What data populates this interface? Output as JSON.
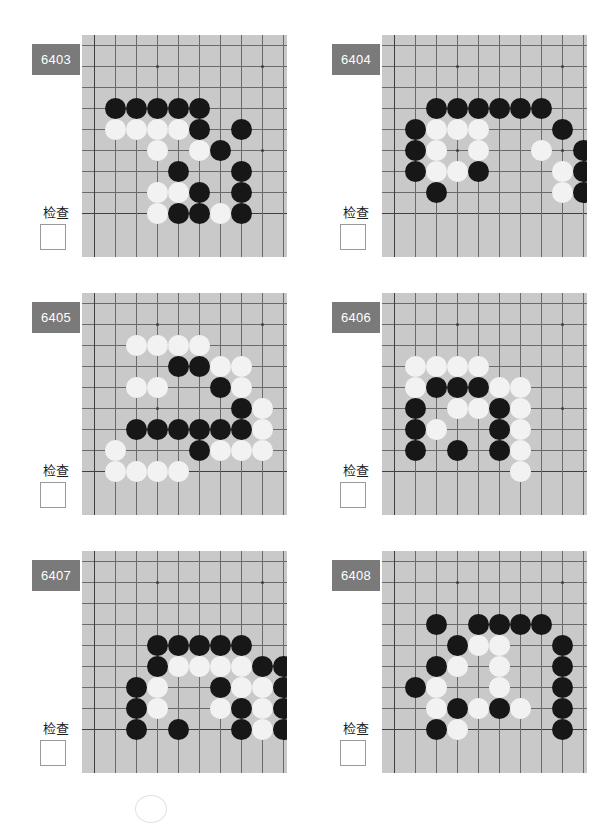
{
  "page": {
    "width": 599,
    "height": 813,
    "background": "#ffffff"
  },
  "theme": {
    "badge_bg": "#7a7a7a",
    "badge_text": "#ffffff",
    "board_bg": "#c9c9c9",
    "grid_line": "#6a6a6a",
    "edge_line": "#3f3f3f",
    "black_stone": "#171717",
    "white_stone": "#f2f2f2",
    "checkbox_border": "#9a9a9a"
  },
  "common": {
    "check_label": "检查",
    "checkbox_checked": false
  },
  "board_geometry": {
    "cols": 9,
    "rows": 9,
    "cell": 21,
    "origin_x": 12,
    "origin_y": 10,
    "left_edge_col": 0,
    "bottom_edge_row": 8,
    "star_points": [
      [
        3,
        1
      ],
      [
        8,
        1
      ],
      [
        3,
        5
      ],
      [
        8,
        5
      ]
    ]
  },
  "puzzles": [
    {
      "id": "6403",
      "position": {
        "left": 10,
        "top": 30
      },
      "check_label": "检查",
      "stones": [
        {
          "c": 1,
          "r": 3,
          "color": "b"
        },
        {
          "c": 2,
          "r": 3,
          "color": "b"
        },
        {
          "c": 3,
          "r": 3,
          "color": "b"
        },
        {
          "c": 4,
          "r": 3,
          "color": "b"
        },
        {
          "c": 5,
          "r": 3,
          "color": "b"
        },
        {
          "c": 1,
          "r": 4,
          "color": "w"
        },
        {
          "c": 2,
          "r": 4,
          "color": "w"
        },
        {
          "c": 3,
          "r": 4,
          "color": "w"
        },
        {
          "c": 4,
          "r": 4,
          "color": "w"
        },
        {
          "c": 5,
          "r": 4,
          "color": "b"
        },
        {
          "c": 7,
          "r": 4,
          "color": "b"
        },
        {
          "c": 3,
          "r": 5,
          "color": "w"
        },
        {
          "c": 5,
          "r": 5,
          "color": "w"
        },
        {
          "c": 6,
          "r": 5,
          "color": "b"
        },
        {
          "c": 4,
          "r": 6,
          "color": "b"
        },
        {
          "c": 7,
          "r": 6,
          "color": "b"
        },
        {
          "c": 3,
          "r": 7,
          "color": "w"
        },
        {
          "c": 4,
          "r": 7,
          "color": "w"
        },
        {
          "c": 5,
          "r": 7,
          "color": "b"
        },
        {
          "c": 7,
          "r": 7,
          "color": "b"
        },
        {
          "c": 3,
          "r": 8,
          "color": "w"
        },
        {
          "c": 4,
          "r": 8,
          "color": "b"
        },
        {
          "c": 5,
          "r": 8,
          "color": "b"
        },
        {
          "c": 6,
          "r": 8,
          "color": "w"
        },
        {
          "c": 7,
          "r": 8,
          "color": "b"
        }
      ]
    },
    {
      "id": "6404",
      "position": {
        "left": 310,
        "top": 30
      },
      "check_label": "检查",
      "stones": [
        {
          "c": 2,
          "r": 3,
          "color": "b"
        },
        {
          "c": 3,
          "r": 3,
          "color": "b"
        },
        {
          "c": 4,
          "r": 3,
          "color": "b"
        },
        {
          "c": 5,
          "r": 3,
          "color": "b"
        },
        {
          "c": 6,
          "r": 3,
          "color": "b"
        },
        {
          "c": 7,
          "r": 3,
          "color": "b"
        },
        {
          "c": 1,
          "r": 4,
          "color": "b"
        },
        {
          "c": 2,
          "r": 4,
          "color": "w"
        },
        {
          "c": 3,
          "r": 4,
          "color": "w"
        },
        {
          "c": 4,
          "r": 4,
          "color": "w"
        },
        {
          "c": 8,
          "r": 4,
          "color": "b"
        },
        {
          "c": 1,
          "r": 5,
          "color": "b"
        },
        {
          "c": 2,
          "r": 5,
          "color": "w"
        },
        {
          "c": 4,
          "r": 5,
          "color": "w"
        },
        {
          "c": 7,
          "r": 5,
          "color": "w"
        },
        {
          "c": 9,
          "r": 5,
          "color": "b"
        },
        {
          "c": 1,
          "r": 6,
          "color": "b"
        },
        {
          "c": 2,
          "r": 6,
          "color": "w"
        },
        {
          "c": 3,
          "r": 6,
          "color": "w"
        },
        {
          "c": 4,
          "r": 6,
          "color": "b"
        },
        {
          "c": 8,
          "r": 6,
          "color": "w"
        },
        {
          "c": 9,
          "r": 6,
          "color": "b"
        },
        {
          "c": 2,
          "r": 7,
          "color": "b"
        },
        {
          "c": 8,
          "r": 7,
          "color": "w"
        },
        {
          "c": 9,
          "r": 7,
          "color": "b"
        }
      ]
    },
    {
      "id": "6405",
      "position": {
        "left": 10,
        "top": 288
      },
      "check_label": "检查",
      "stones": [
        {
          "c": 2,
          "r": 2,
          "color": "w"
        },
        {
          "c": 3,
          "r": 2,
          "color": "w"
        },
        {
          "c": 4,
          "r": 2,
          "color": "w"
        },
        {
          "c": 5,
          "r": 2,
          "color": "w"
        },
        {
          "c": 4,
          "r": 3,
          "color": "b"
        },
        {
          "c": 5,
          "r": 3,
          "color": "b"
        },
        {
          "c": 6,
          "r": 3,
          "color": "w"
        },
        {
          "c": 7,
          "r": 3,
          "color": "w"
        },
        {
          "c": 2,
          "r": 4,
          "color": "w"
        },
        {
          "c": 3,
          "r": 4,
          "color": "w"
        },
        {
          "c": 6,
          "r": 4,
          "color": "b"
        },
        {
          "c": 7,
          "r": 4,
          "color": "w"
        },
        {
          "c": 7,
          "r": 5,
          "color": "b"
        },
        {
          "c": 8,
          "r": 5,
          "color": "w"
        },
        {
          "c": 2,
          "r": 6,
          "color": "b"
        },
        {
          "c": 3,
          "r": 6,
          "color": "b"
        },
        {
          "c": 4,
          "r": 6,
          "color": "b"
        },
        {
          "c": 5,
          "r": 6,
          "color": "b"
        },
        {
          "c": 6,
          "r": 6,
          "color": "b"
        },
        {
          "c": 7,
          "r": 6,
          "color": "b"
        },
        {
          "c": 8,
          "r": 6,
          "color": "w"
        },
        {
          "c": 1,
          "r": 7,
          "color": "w"
        },
        {
          "c": 5,
          "r": 7,
          "color": "b"
        },
        {
          "c": 6,
          "r": 7,
          "color": "w"
        },
        {
          "c": 7,
          "r": 7,
          "color": "w"
        },
        {
          "c": 8,
          "r": 7,
          "color": "w"
        },
        {
          "c": 1,
          "r": 8,
          "color": "w"
        },
        {
          "c": 2,
          "r": 8,
          "color": "w"
        },
        {
          "c": 3,
          "r": 8,
          "color": "w"
        },
        {
          "c": 4,
          "r": 8,
          "color": "w"
        }
      ]
    },
    {
      "id": "6406",
      "position": {
        "left": 310,
        "top": 288
      },
      "check_label": "检查",
      "stones": [
        {
          "c": 1,
          "r": 3,
          "color": "w"
        },
        {
          "c": 2,
          "r": 3,
          "color": "w"
        },
        {
          "c": 3,
          "r": 3,
          "color": "w"
        },
        {
          "c": 4,
          "r": 3,
          "color": "w"
        },
        {
          "c": 1,
          "r": 4,
          "color": "w"
        },
        {
          "c": 2,
          "r": 4,
          "color": "b"
        },
        {
          "c": 3,
          "r": 4,
          "color": "b"
        },
        {
          "c": 4,
          "r": 4,
          "color": "b"
        },
        {
          "c": 5,
          "r": 4,
          "color": "w"
        },
        {
          "c": 6,
          "r": 4,
          "color": "w"
        },
        {
          "c": 1,
          "r": 5,
          "color": "b"
        },
        {
          "c": 3,
          "r": 5,
          "color": "w"
        },
        {
          "c": 4,
          "r": 5,
          "color": "w"
        },
        {
          "c": 5,
          "r": 5,
          "color": "b"
        },
        {
          "c": 6,
          "r": 5,
          "color": "w"
        },
        {
          "c": 1,
          "r": 6,
          "color": "b"
        },
        {
          "c": 2,
          "r": 6,
          "color": "w"
        },
        {
          "c": 5,
          "r": 6,
          "color": "b"
        },
        {
          "c": 6,
          "r": 6,
          "color": "w"
        },
        {
          "c": 1,
          "r": 7,
          "color": "b"
        },
        {
          "c": 3,
          "r": 7,
          "color": "b"
        },
        {
          "c": 5,
          "r": 7,
          "color": "b"
        },
        {
          "c": 6,
          "r": 7,
          "color": "w"
        },
        {
          "c": 6,
          "r": 8,
          "color": "w"
        }
      ]
    },
    {
      "id": "6407",
      "position": {
        "left": 10,
        "top": 546
      },
      "check_label": "检查",
      "stones": [
        {
          "c": 3,
          "r": 4,
          "color": "b"
        },
        {
          "c": 4,
          "r": 4,
          "color": "b"
        },
        {
          "c": 5,
          "r": 4,
          "color": "b"
        },
        {
          "c": 6,
          "r": 4,
          "color": "b"
        },
        {
          "c": 7,
          "r": 4,
          "color": "b"
        },
        {
          "c": 3,
          "r": 5,
          "color": "b"
        },
        {
          "c": 4,
          "r": 5,
          "color": "w"
        },
        {
          "c": 5,
          "r": 5,
          "color": "w"
        },
        {
          "c": 6,
          "r": 5,
          "color": "w"
        },
        {
          "c": 7,
          "r": 5,
          "color": "w"
        },
        {
          "c": 8,
          "r": 5,
          "color": "b"
        },
        {
          "c": 9,
          "r": 5,
          "color": "b"
        },
        {
          "c": 2,
          "r": 6,
          "color": "b"
        },
        {
          "c": 3,
          "r": 6,
          "color": "w"
        },
        {
          "c": 6,
          "r": 6,
          "color": "b"
        },
        {
          "c": 7,
          "r": 6,
          "color": "w"
        },
        {
          "c": 8,
          "r": 6,
          "color": "w"
        },
        {
          "c": 9,
          "r": 6,
          "color": "b"
        },
        {
          "c": 2,
          "r": 7,
          "color": "b"
        },
        {
          "c": 3,
          "r": 7,
          "color": "w"
        },
        {
          "c": 6,
          "r": 7,
          "color": "w"
        },
        {
          "c": 7,
          "r": 7,
          "color": "b"
        },
        {
          "c": 8,
          "r": 7,
          "color": "w"
        },
        {
          "c": 9,
          "r": 7,
          "color": "b"
        },
        {
          "c": 2,
          "r": 8,
          "color": "b"
        },
        {
          "c": 4,
          "r": 8,
          "color": "b"
        },
        {
          "c": 7,
          "r": 8,
          "color": "b"
        },
        {
          "c": 8,
          "r": 8,
          "color": "w"
        },
        {
          "c": 9,
          "r": 8,
          "color": "b"
        }
      ]
    },
    {
      "id": "6408",
      "position": {
        "left": 310,
        "top": 546
      },
      "check_label": "检查",
      "stones": [
        {
          "c": 2,
          "r": 3,
          "color": "b"
        },
        {
          "c": 4,
          "r": 3,
          "color": "b"
        },
        {
          "c": 5,
          "r": 3,
          "color": "b"
        },
        {
          "c": 6,
          "r": 3,
          "color": "b"
        },
        {
          "c": 7,
          "r": 3,
          "color": "b"
        },
        {
          "c": 3,
          "r": 4,
          "color": "b"
        },
        {
          "c": 4,
          "r": 4,
          "color": "w"
        },
        {
          "c": 5,
          "r": 4,
          "color": "w"
        },
        {
          "c": 8,
          "r": 4,
          "color": "b"
        },
        {
          "c": 2,
          "r": 5,
          "color": "b"
        },
        {
          "c": 3,
          "r": 5,
          "color": "w"
        },
        {
          "c": 5,
          "r": 5,
          "color": "w"
        },
        {
          "c": 8,
          "r": 5,
          "color": "b"
        },
        {
          "c": 1,
          "r": 6,
          "color": "b"
        },
        {
          "c": 2,
          "r": 6,
          "color": "w"
        },
        {
          "c": 5,
          "r": 6,
          "color": "w"
        },
        {
          "c": 8,
          "r": 6,
          "color": "b"
        },
        {
          "c": 2,
          "r": 7,
          "color": "w"
        },
        {
          "c": 3,
          "r": 7,
          "color": "b"
        },
        {
          "c": 4,
          "r": 7,
          "color": "w"
        },
        {
          "c": 5,
          "r": 7,
          "color": "b"
        },
        {
          "c": 6,
          "r": 7,
          "color": "w"
        },
        {
          "c": 8,
          "r": 7,
          "color": "b"
        },
        {
          "c": 2,
          "r": 8,
          "color": "b"
        },
        {
          "c": 3,
          "r": 8,
          "color": "w"
        },
        {
          "c": 8,
          "r": 8,
          "color": "b"
        }
      ]
    }
  ]
}
